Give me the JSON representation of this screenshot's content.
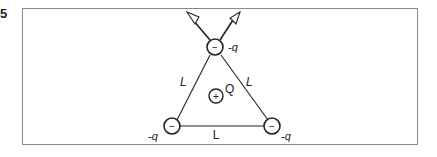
{
  "problem": {
    "number": "5"
  },
  "diagram": {
    "charges": [
      {
        "id": "top",
        "sign": "−",
        "label": "-q"
      },
      {
        "id": "bottom-left",
        "sign": "−",
        "label": "-q"
      },
      {
        "id": "bottom-right",
        "sign": "−",
        "label": "-q"
      },
      {
        "id": "center",
        "sign": "+",
        "label": "Q"
      }
    ],
    "sides": {
      "left": "L",
      "right": "L",
      "bottom": "L"
    },
    "colors": {
      "stroke": "#222222",
      "box_border": "#8a8a8a"
    }
  }
}
